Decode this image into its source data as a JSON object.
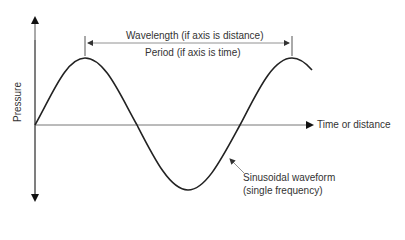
{
  "diagram": {
    "type": "sine-waveform",
    "labels": {
      "wavelength": "Wavelength (if axis is distance)",
      "period": "Period (if axis is time)",
      "y_axis": "Pressure",
      "x_axis": "Time or distance",
      "waveform_line1": "Sinusoidal waveform",
      "waveform_line2": "(single frequency)"
    },
    "colors": {
      "curve": "#222222",
      "axis": "#555555",
      "text": "#333333"
    }
  }
}
